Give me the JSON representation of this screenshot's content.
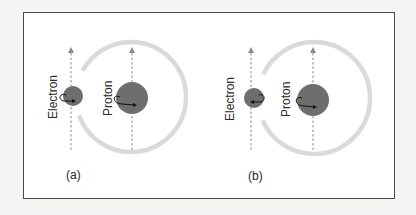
{
  "figure": {
    "panels": [
      {
        "id": "a",
        "caption": "(a)",
        "electron_label": "Electron",
        "proton_label": "Proton",
        "electron_spin": "counterclockwise arrow pointing right (parallel to proton)",
        "proton_spin": "arrow pointing right"
      },
      {
        "id": "b",
        "caption": "(b)",
        "electron_label": "Electron",
        "proton_label": "Proton",
        "electron_spin": "arrow pointing left (antiparallel to proton)",
        "proton_spin": "arrow pointing right"
      }
    ],
    "colors": {
      "particle": "#6e6e6e",
      "ring": "#d9d9d9",
      "axis": "#8a8a8a",
      "arrow": "#111111",
      "border": "#4a4a4a"
    }
  }
}
